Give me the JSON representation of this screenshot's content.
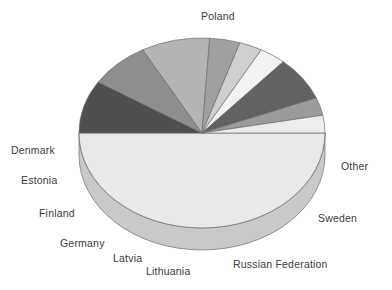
{
  "chart_data": {
    "type": "pie",
    "title": "",
    "subtitle": "",
    "xlabel": "",
    "ylabel": "",
    "grid": false,
    "legend_position": "none",
    "label_placement": "outside-callout",
    "three_d": true,
    "start_angle_deg": 0,
    "direction": "clockwise",
    "categories": [
      "Poland",
      "Other",
      "Sweden",
      "Russian Federation",
      "Lithuania",
      "Latvia",
      "Germany",
      "Finland",
      "Estonia",
      "Denmark"
    ],
    "values": [
      50.0,
      9.0,
      8.0,
      9.0,
      4.0,
      3.0,
      3.5,
      7.5,
      3.0,
      3.0
    ],
    "slices": [
      {
        "label": "Poland",
        "value": 50.0,
        "color": "#e9e9e9",
        "side_color": "#c9c9c9"
      },
      {
        "label": "Other",
        "value": 9.0,
        "color": "#4f4f4f",
        "side_color": "#3a3a3a"
      },
      {
        "label": "Sweden",
        "value": 8.0,
        "color": "#8e8e8e",
        "side_color": "#6e6e6e"
      },
      {
        "label": "Russian Federation",
        "value": 9.0,
        "color": "#b4b4b4",
        "side_color": "#929292"
      },
      {
        "label": "Lithuania",
        "value": 4.0,
        "color": "#a0a0a0",
        "side_color": "#808080"
      },
      {
        "label": "Latvia",
        "value": 3.0,
        "color": "#cfcfcf",
        "side_color": "#a8a8a8"
      },
      {
        "label": "Germany",
        "value": 3.5,
        "color": "#f2f2f2",
        "side_color": "#cccccc"
      },
      {
        "label": "Finland",
        "value": 7.5,
        "color": "#626262",
        "side_color": "#4a4a4a"
      },
      {
        "label": "Estonia",
        "value": 3.0,
        "color": "#9b9b9b",
        "side_color": "#7b7b7b"
      },
      {
        "label": "Denmark",
        "value": 3.0,
        "color": "#ededed",
        "side_color": "#c6c6c6"
      }
    ]
  },
  "labels": {
    "poland": "Poland",
    "other": "Other",
    "sweden": "Sweden",
    "russian_federation": "Russian Federation",
    "lithuania": "Lithuania",
    "latvia": "Latvia",
    "germany": "Germany",
    "finland": "Finland",
    "estonia": "Estonia",
    "denmark": "Denmark"
  },
  "style": {
    "background": "#ffffff",
    "label_color": "#3b3b3b",
    "outline_color": "#6b6b6b"
  }
}
